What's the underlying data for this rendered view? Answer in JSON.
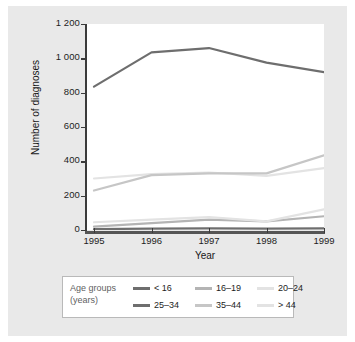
{
  "chart_data": {
    "type": "line",
    "title": "",
    "xlabel": "Year",
    "ylabel": "Number of diagnoses",
    "categories": [
      "1995",
      "1996",
      "1997",
      "1998",
      "1999"
    ],
    "x": [
      1995,
      1996,
      1997,
      1998,
      1999
    ],
    "xlim": [
      1995,
      1999
    ],
    "ylim": [
      0,
      1200
    ],
    "yticks": [
      "0",
      "200",
      "400",
      "600",
      "800",
      "1 000",
      "1 200"
    ],
    "ytick_values": [
      0,
      200,
      400,
      600,
      800,
      1000,
      1200
    ],
    "grid": false,
    "legend_position": "bottom",
    "legend_title": "Age groups (years)",
    "series": [
      {
        "name": "< 16",
        "values": [
          5,
          8,
          10,
          8,
          10
        ],
        "color": "#6e6e6e"
      },
      {
        "name": "16–19",
        "values": [
          20,
          40,
          60,
          50,
          80
        ],
        "color": "#b4b4b4"
      },
      {
        "name": "20–24",
        "values": [
          300,
          325,
          335,
          315,
          360
        ],
        "color": "#e3e3e3"
      },
      {
        "name": "25–34",
        "values": [
          835,
          1035,
          1060,
          975,
          920
        ],
        "color": "#6e6e6e"
      },
      {
        "name": "35–44",
        "values": [
          230,
          320,
          330,
          330,
          435
        ],
        "color": "#c6c6c6"
      },
      {
        "name": "> 44",
        "values": [
          45,
          60,
          75,
          50,
          120
        ],
        "color": "#e3e3e3"
      }
    ]
  },
  "legend": {
    "title_line1": "Age groups",
    "title_line2": "(years)",
    "items": [
      {
        "label": "< 16",
        "color": "#6e6e6e"
      },
      {
        "label": "16–19",
        "color": "#b4b4b4"
      },
      {
        "label": "20–24",
        "color": "#e3e3e3"
      },
      {
        "label": "25–34",
        "color": "#6e6e6e"
      },
      {
        "label": "35–44",
        "color": "#c6c6c6"
      },
      {
        "label": "> 44",
        "color": "#e3e3e3"
      }
    ]
  },
  "axes": {
    "y_title": "Number of diagnoses",
    "x_title": "Year"
  }
}
